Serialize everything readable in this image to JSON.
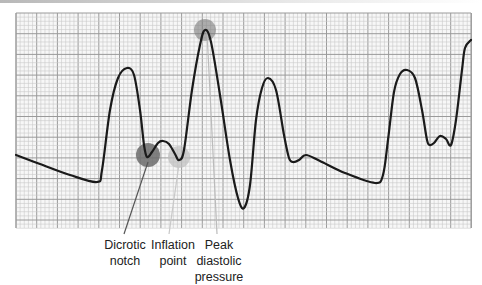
{
  "diagram": {
    "grid": {
      "x0": 16,
      "y0": 13,
      "x1": 471,
      "y1": 228,
      "minor": 4.14,
      "major_every": 5,
      "minor_color": "#c9c9c9",
      "major_color": "#9a9a9a"
    },
    "waveform_points": [
      [
        16,
        155
      ],
      [
        40,
        164
      ],
      [
        70,
        175
      ],
      [
        97,
        182
      ],
      [
        102,
        170
      ],
      [
        110,
        110
      ],
      [
        118,
        78
      ],
      [
        127,
        68
      ],
      [
        134,
        75
      ],
      [
        140,
        110
      ],
      [
        144,
        145
      ],
      [
        147,
        157
      ],
      [
        152,
        152
      ],
      [
        158,
        143
      ],
      [
        163,
        141
      ],
      [
        169,
        144
      ],
      [
        175,
        154
      ],
      [
        179,
        160
      ],
      [
        184,
        150
      ],
      [
        192,
        90
      ],
      [
        200,
        45
      ],
      [
        205,
        30
      ],
      [
        211,
        42
      ],
      [
        220,
        95
      ],
      [
        230,
        160
      ],
      [
        238,
        198
      ],
      [
        244,
        208
      ],
      [
        250,
        185
      ],
      [
        256,
        120
      ],
      [
        262,
        88
      ],
      [
        268,
        78
      ],
      [
        276,
        90
      ],
      [
        284,
        135
      ],
      [
        289,
        158
      ],
      [
        293,
        162
      ],
      [
        299,
        160
      ],
      [
        306,
        155
      ],
      [
        320,
        161
      ],
      [
        345,
        173
      ],
      [
        375,
        183
      ],
      [
        383,
        175
      ],
      [
        388,
        140
      ],
      [
        394,
        92
      ],
      [
        400,
        74
      ],
      [
        407,
        70
      ],
      [
        415,
        78
      ],
      [
        422,
        110
      ],
      [
        427,
        140
      ],
      [
        430,
        145
      ],
      [
        434,
        143
      ],
      [
        440,
        136
      ],
      [
        446,
        139
      ],
      [
        451,
        145
      ],
      [
        456,
        120
      ],
      [
        462,
        70
      ],
      [
        465,
        48
      ],
      [
        471,
        40
      ]
    ],
    "markers": [
      {
        "name": "dicrotic-notch-marker",
        "cx": 148,
        "cy": 155,
        "r": 12,
        "color": "#6b6b6b",
        "opacity": 0.85
      },
      {
        "name": "inflation-point-marker",
        "cx": 179,
        "cy": 157,
        "r": 11,
        "color": "#bdbdbd",
        "opacity": 0.7
      },
      {
        "name": "peak-diastolic-marker",
        "cx": 205,
        "cy": 30,
        "r": 11,
        "color": "#7a7a7a",
        "opacity": 0.6
      }
    ],
    "leaders": [
      {
        "name": "dicrotic-notch-leader",
        "x1": 148,
        "y1": 162,
        "x2": 124,
        "y2": 234,
        "color": "#555555"
      },
      {
        "name": "inflation-point-leader",
        "x1": 179,
        "y1": 164,
        "x2": 169,
        "y2": 234,
        "color": "#c8c8c8"
      },
      {
        "name": "peak-diastolic-leader",
        "x1": 207,
        "y1": 32,
        "x2": 217,
        "y2": 234,
        "color": "#bbbbbb"
      }
    ],
    "labels": [
      {
        "id": "dicrotic",
        "lines": [
          "Dicrotic",
          "notch"
        ]
      },
      {
        "id": "inflation",
        "lines": [
          "Inflation",
          "point"
        ]
      },
      {
        "id": "peak",
        "lines": [
          "Peak",
          "diastolic",
          "pressure"
        ]
      }
    ]
  }
}
